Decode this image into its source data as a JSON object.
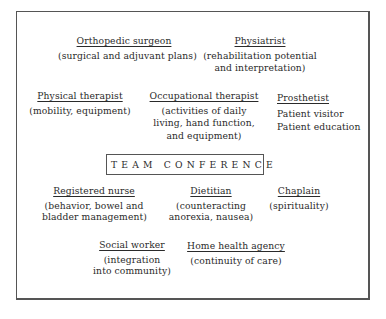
{
  "diagram": {
    "center": {
      "label": "TEAM CONFERENCE"
    },
    "members": {
      "orthopedic_surgeon": {
        "title": "Orthopedic surgeon",
        "lines": [
          "(surgical and adjuvant plans)"
        ]
      },
      "physiatrist": {
        "title": "Physiatrist",
        "lines": [
          "(rehabilitation potential",
          "and interpretation)"
        ]
      },
      "physical_therapist": {
        "title": "Physical therapist",
        "lines": [
          "(mobility, equipment)"
        ]
      },
      "occupational_therapist": {
        "title": "Occupational therapist",
        "lines": [
          "(activities of daily",
          "living, hand function,",
          "and equipment)"
        ]
      },
      "prosthetist": {
        "title": "Prosthetist",
        "lines": [
          "Patient visitor",
          "Patient education"
        ]
      },
      "registered_nurse": {
        "title": "Registered nurse",
        "lines": [
          "(behavior, bowel and",
          "bladder management)"
        ]
      },
      "dietitian": {
        "title": "Dietitian",
        "lines": [
          "(counteracting",
          "anorexia, nausea)"
        ]
      },
      "chaplain": {
        "title": "Chaplain",
        "lines": [
          "(spirituality)"
        ]
      },
      "social_worker": {
        "title": "Social worker",
        "lines": [
          "(integration",
          "into community)"
        ]
      },
      "home_health_agency": {
        "title": "Home health agency",
        "lines": [
          "(continuity of care)"
        ]
      }
    }
  }
}
